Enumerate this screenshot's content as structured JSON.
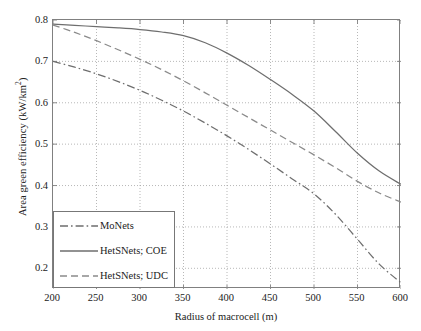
{
  "chart_data": {
    "type": "line",
    "title": "",
    "xlabel": "Radius of macrocell (m)",
    "ylabel": "Area green efficiency (kW/km",
    "ylabel_sup": "2",
    "ylabel_tail": ")",
    "xlim": [
      200,
      600
    ],
    "ylim": [
      0.15,
      0.8
    ],
    "grid": true,
    "xticks": [
      200,
      250,
      300,
      350,
      400,
      450,
      500,
      550,
      600
    ],
    "yticks": [
      0.2,
      0.3,
      0.4,
      0.5,
      0.6,
      0.7,
      0.8
    ],
    "ytick_labels": [
      "0.2",
      "0.3",
      "0.4",
      "0.5",
      "0.6",
      "0.7",
      "0.8"
    ],
    "xtick_labels": [
      "200",
      "250",
      "300",
      "350",
      "400",
      "450",
      "500",
      "550",
      "600"
    ],
    "legend_position": "lower left",
    "x": [
      200,
      225,
      250,
      275,
      300,
      325,
      350,
      375,
      400,
      425,
      450,
      475,
      500,
      525,
      550,
      575,
      600
    ],
    "series": [
      {
        "name": "MoNets",
        "style": "dashdot",
        "color": "#6e6e6e",
        "values": [
          0.7,
          0.686,
          0.67,
          0.651,
          0.63,
          0.606,
          0.58,
          0.551,
          0.52,
          0.487,
          0.452,
          0.416,
          0.38,
          0.33,
          0.27,
          0.21,
          0.165
        ]
      },
      {
        "name": "HetSNets; COE",
        "style": "solid",
        "color": "#6e6e6e",
        "values": [
          0.79,
          0.787,
          0.784,
          0.781,
          0.777,
          0.771,
          0.762,
          0.745,
          0.72,
          0.69,
          0.656,
          0.62,
          0.58,
          0.53,
          0.478,
          0.435,
          0.403
        ]
      },
      {
        "name": "HetSNets; UDC",
        "style": "dashed",
        "color": "#8a8a8a",
        "values": [
          0.788,
          0.77,
          0.75,
          0.728,
          0.705,
          0.68,
          0.653,
          0.624,
          0.594,
          0.564,
          0.534,
          0.504,
          0.474,
          0.443,
          0.41,
          0.382,
          0.36
        ]
      }
    ]
  },
  "legend": {
    "items": [
      {
        "label": "MoNets"
      },
      {
        "label": "HetSNets; COE"
      },
      {
        "label": "HetSNets; UDC"
      }
    ]
  }
}
